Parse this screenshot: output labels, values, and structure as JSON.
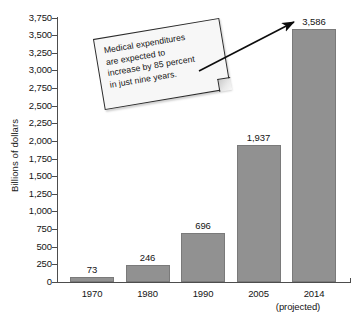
{
  "chart_data": {
    "type": "bar",
    "title": "",
    "xlabel": "",
    "ylabel": "Billions of dollars",
    "categories": [
      "1970",
      "1980",
      "1990",
      "2005",
      "2014"
    ],
    "values": [
      73,
      246,
      696,
      1937,
      3586
    ],
    "value_labels": [
      "73",
      "246",
      "696",
      "1,937",
      "3,586"
    ],
    "category_notes": [
      "",
      "",
      "",
      "",
      "(projected)"
    ],
    "ylim": [
      0,
      3750
    ],
    "ytick_step": 250,
    "ytick_labels": [
      "3,750",
      "3,500",
      "3,250",
      "3,000",
      "2,750",
      "2,500",
      "2,250",
      "2,000",
      "1,750",
      "1,500",
      "1,250",
      "1,000",
      "750",
      "500",
      "250",
      "0"
    ],
    "grid": false,
    "legend": "none",
    "bar_color": "#919191",
    "axis_color": "#4d4d4d",
    "background": "#ffffff",
    "annotations": [
      {
        "name": "callout",
        "text": "Medical expenditures are expected to increase by 85 percent in just nine years.",
        "lines": [
          "Medical expenditures",
          "are expected to",
          "increase by 85 percent",
          "in just nine years."
        ],
        "points_to": "2014"
      }
    ]
  }
}
